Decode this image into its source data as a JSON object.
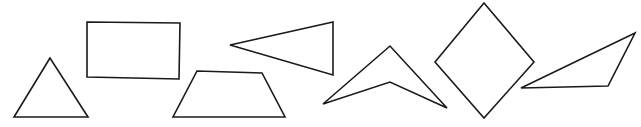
{
  "diagram": {
    "title": "",
    "width": 641,
    "height": 127,
    "stroke_color": "#1a1a1a",
    "background": "#ffffff",
    "shapes": [
      {
        "id": "shape-1",
        "kind": "triangle",
        "description": "isosceles triangle",
        "points": "50,58 14,117 88,117"
      },
      {
        "id": "shape-2",
        "kind": "rectangle",
        "description": "rectangle",
        "points": "87,22 180,23 179,79 87,77"
      },
      {
        "id": "shape-3",
        "kind": "trapezoid",
        "description": "trapezoid",
        "points": "197,71 262,73 285,117 173,117"
      },
      {
        "id": "shape-4",
        "kind": "triangle",
        "description": "acute triangle pointing left",
        "points": "230,45 333,22 333,75"
      },
      {
        "id": "shape-5",
        "kind": "concave-quadrilateral",
        "description": "concave quadrilateral (dart/chevron)",
        "points": "323,104 390,46 447,108 390,82"
      },
      {
        "id": "shape-6",
        "kind": "rhombus",
        "description": "rhombus / kite",
        "points": "484,3 534,62 484,118 435,62"
      },
      {
        "id": "shape-7",
        "kind": "triangle",
        "description": "obtuse triangle",
        "points": "521,88 635,33 608,86"
      }
    ]
  }
}
